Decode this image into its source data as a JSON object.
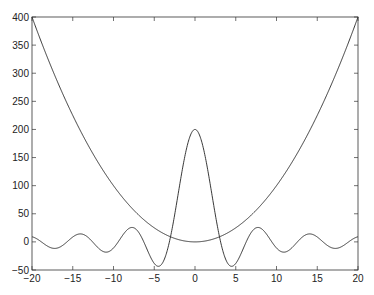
{
  "chart_data": {
    "type": "line",
    "title": "",
    "xlabel": "",
    "ylabel": "",
    "xlim": [
      -20,
      20
    ],
    "ylim": [
      -50,
      400
    ],
    "xticks": [
      -20,
      -15,
      -10,
      -5,
      0,
      5,
      10,
      15,
      20
    ],
    "yticks": [
      -50,
      0,
      50,
      100,
      150,
      200,
      250,
      300,
      350,
      400
    ],
    "grid": false,
    "legend": null,
    "series": [
      {
        "name": "x^2",
        "formula": "x*x",
        "x_range": [
          -20,
          20
        ],
        "x": [
          -20,
          -15,
          -10,
          -5,
          0,
          5,
          10,
          15,
          20
        ],
        "values": [
          400,
          225,
          100,
          25,
          0,
          25,
          100,
          225,
          400
        ]
      },
      {
        "name": "200*sin(x)/x",
        "formula": "200*sin(x)/x",
        "x_range": [
          -20,
          20
        ],
        "x": [
          -20,
          -17.2,
          -14.1,
          -10.9,
          -7.7,
          -4.5,
          0,
          4.5,
          7.7,
          10.9,
          14.1,
          17.2,
          20
        ],
        "values": [
          9.1,
          -11.5,
          14.1,
          -18.2,
          25.7,
          -43.4,
          200,
          -43.4,
          25.7,
          -18.2,
          14.1,
          -11.5,
          9.1
        ]
      }
    ],
    "line_color": "#222222"
  }
}
